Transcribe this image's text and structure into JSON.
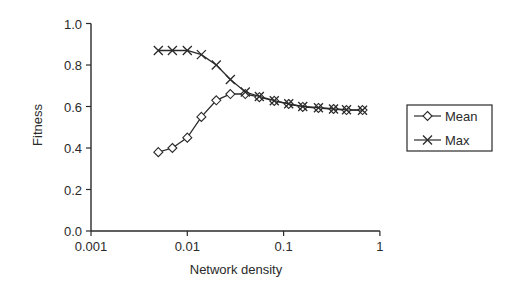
{
  "chart_data": {
    "type": "line",
    "title": "",
    "xlabel": "Network density",
    "ylabel": "Fitness",
    "xscale": "log",
    "xlim": [
      0.001,
      1
    ],
    "ylim": [
      0.0,
      1.0
    ],
    "grid": false,
    "legend_position": "right",
    "x_ticks": [
      "0.001",
      "0.01",
      "0.1",
      "1"
    ],
    "y_ticks": [
      "0.0",
      "0.2",
      "0.4",
      "0.6",
      "0.8",
      "1.0"
    ],
    "x": [
      0.005,
      0.007,
      0.01,
      0.014,
      0.02,
      0.028,
      0.04,
      0.056,
      0.08,
      0.113,
      0.158,
      0.23,
      0.33,
      0.45,
      0.66
    ],
    "series": [
      {
        "name": "Mean",
        "marker": "diamond",
        "values": [
          0.38,
          0.4,
          0.45,
          0.55,
          0.63,
          0.66,
          0.66,
          0.645,
          0.627,
          0.612,
          0.598,
          0.593,
          0.588,
          0.583,
          0.583
        ]
      },
      {
        "name": "Max",
        "marker": "x",
        "values": [
          0.87,
          0.87,
          0.87,
          0.85,
          0.8,
          0.73,
          0.67,
          0.648,
          0.628,
          0.613,
          0.6,
          0.594,
          0.588,
          0.584,
          0.582
        ]
      }
    ]
  },
  "legend": {
    "items": [
      {
        "label": "Mean"
      },
      {
        "label": "Max"
      }
    ]
  },
  "colors": {
    "line": "#2a2a2a",
    "background": "#ffffff"
  }
}
